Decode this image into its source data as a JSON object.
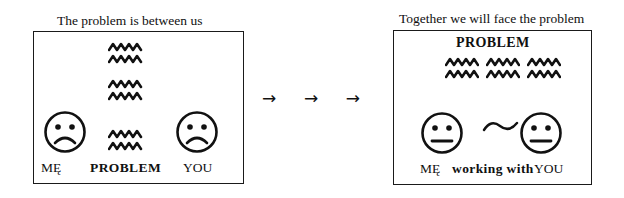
{
  "diagram": {
    "ink_color": "#111111",
    "background_color": "#ffffff",
    "panels": [
      {
        "id": "before",
        "caption": "The problem is between us",
        "heading": "",
        "left_face": {
          "expression": "sad",
          "label": "MĘ"
        },
        "right_face": {
          "expression": "sad",
          "label": "YOU"
        },
        "center_label": "PROBLEM",
        "connector": "",
        "squiggle_layout": "vertical-column",
        "squiggle_rows": 6
      },
      {
        "id": "after",
        "caption": "Together we will face the problem",
        "heading": "PROBLEM",
        "left_face": {
          "expression": "neutral",
          "label": "MĘ"
        },
        "right_face": {
          "expression": "neutral",
          "label": "YOU"
        },
        "center_label": "working with",
        "connector": "~",
        "squiggle_layout": "horizontal-band",
        "squiggle_rows": 2,
        "squiggle_columns": 3
      }
    ],
    "transition": {
      "arrows": [
        "→",
        "→",
        "→"
      ],
      "icon_name": "right-arrow-icon"
    }
  }
}
